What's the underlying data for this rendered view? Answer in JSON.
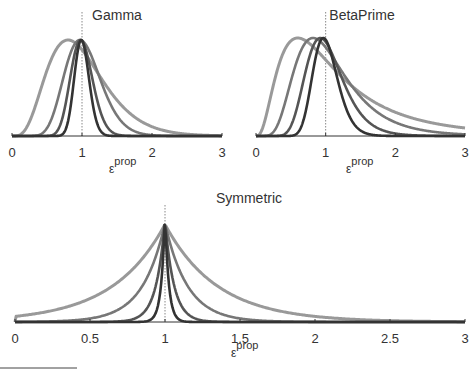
{
  "chart_data": [
    {
      "type": "line",
      "title": "Gamma",
      "xlabel": "ε",
      "xlabel_superscript": "prop",
      "xlim": [
        0,
        3
      ],
      "x_ticks": [
        "0",
        "1",
        "2",
        "3"
      ],
      "x_tick_values": [
        0,
        1,
        2,
        3
      ],
      "reference_line_x": 1,
      "normalized_peak": true,
      "distribution": "gamma",
      "series": [
        {
          "name": "widest",
          "shape_k": 5,
          "mode": 0.8,
          "color": "#999999"
        },
        {
          "name": "wide",
          "shape_k": 15,
          "mode": 0.97,
          "color": "#777777"
        },
        {
          "name": "narrow",
          "shape_k": 40,
          "mode": 0.98,
          "color": "#555555"
        },
        {
          "name": "narrowest",
          "shape_k": 90,
          "mode": 0.99,
          "color": "#333333"
        }
      ]
    },
    {
      "type": "line",
      "title": "BetaPrime",
      "xlabel": "ε",
      "xlabel_superscript": "prop",
      "xlim": [
        0,
        3
      ],
      "x_ticks": [
        "0",
        "1",
        "2",
        "3"
      ],
      "x_tick_values": [
        0,
        1,
        2,
        3
      ],
      "reference_line_x": 1,
      "normalized_peak": true,
      "distribution": "betaprime",
      "series": [
        {
          "name": "widest",
          "alpha": 4,
          "beta": 4,
          "mode": 0.75,
          "color": "#999999"
        },
        {
          "name": "wide",
          "alpha": 10,
          "beta": 10,
          "mode": 0.9,
          "color": "#777777"
        },
        {
          "name": "narrow",
          "alpha": 25,
          "beta": 25,
          "mode": 0.96,
          "color": "#555555"
        },
        {
          "name": "narrowest",
          "alpha": 60,
          "beta": 60,
          "mode": 0.98,
          "color": "#333333"
        }
      ]
    },
    {
      "type": "line",
      "title": "Symmetric",
      "xlabel": "ε",
      "xlabel_superscript": "prop",
      "xlim": [
        0,
        3
      ],
      "x_ticks": [
        "0",
        "0.5",
        "1",
        "1.5",
        "2",
        "2.5",
        "3"
      ],
      "x_tick_values": [
        0,
        0.5,
        1,
        1.5,
        2,
        2.5,
        3
      ],
      "reference_line_x": 1,
      "normalized_peak": true,
      "distribution": "symmetric-log-laplace",
      "series": [
        {
          "name": "widest",
          "scale": 0.35,
          "color": "#999999"
        },
        {
          "name": "wide",
          "scale": 0.15,
          "color": "#777777"
        },
        {
          "name": "narrow",
          "scale": 0.06,
          "color": "#555555"
        },
        {
          "name": "narrowest",
          "scale": 0.025,
          "color": "#333333"
        }
      ]
    }
  ]
}
